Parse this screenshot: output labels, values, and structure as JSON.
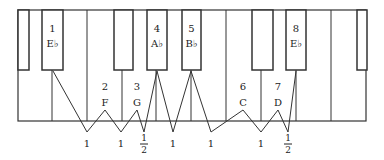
{
  "diagram": {
    "colors": {
      "line": "#333333",
      "background": "#ffffff",
      "text": "#222222"
    },
    "keyboard": {
      "top": 10,
      "bottom": 121,
      "black_bottom": 70,
      "white_dividers": [
        18,
        52,
        87,
        122,
        156,
        191,
        226,
        261,
        296,
        331,
        366
      ],
      "black_keys": [
        {
          "x1": 18,
          "x2": 29,
          "label_num": "",
          "label_note": ""
        },
        {
          "x1": 42,
          "x2": 63,
          "label_num": "1",
          "label_note": "E♭"
        },
        {
          "x1": 114,
          "x2": 133,
          "label_num": "",
          "label_note": ""
        },
        {
          "x1": 147,
          "x2": 167,
          "label_num": "4",
          "label_note": "A♭"
        },
        {
          "x1": 182,
          "x2": 201,
          "label_num": "5",
          "label_note": "B♭"
        },
        {
          "x1": 252,
          "x2": 273,
          "label_num": "",
          "label_note": ""
        },
        {
          "x1": 286,
          "x2": 306,
          "label_num": "8",
          "label_note": "E♭"
        },
        {
          "x1": 357,
          "x2": 367,
          "label_num": "",
          "label_note": ""
        }
      ]
    },
    "white_labels": [
      {
        "x": 105,
        "num": "2",
        "note": "F"
      },
      {
        "x": 137,
        "num": "3",
        "note": "G"
      },
      {
        "x": 243,
        "num": "6",
        "note": "C"
      },
      {
        "x": 278,
        "num": "7",
        "note": "D"
      }
    ],
    "scale_degrees": [
      "1",
      "2",
      "3",
      "4",
      "5",
      "6",
      "7",
      "8"
    ],
    "scale_notes": [
      "E♭",
      "F",
      "G",
      "A♭",
      "B♭",
      "C",
      "D",
      "E♭"
    ],
    "intervals": [
      {
        "x": 87,
        "label": "1",
        "kind": "whole"
      },
      {
        "x": 121,
        "label": "1",
        "kind": "whole"
      },
      {
        "x": 144,
        "label_num": "1",
        "label_den": "2",
        "kind": "half"
      },
      {
        "x": 173,
        "label": "1",
        "kind": "whole"
      },
      {
        "x": 211,
        "label": "1",
        "kind": "whole"
      },
      {
        "x": 261,
        "label": "1",
        "kind": "whole"
      },
      {
        "x": 288,
        "label_num": "1",
        "label_den": "2",
        "kind": "half"
      }
    ],
    "zigzag_points": [
      [
        53,
        71
      ],
      [
        87,
        132
      ],
      [
        105,
        110
      ],
      [
        121,
        132
      ],
      [
        137,
        110
      ],
      [
        144,
        132
      ],
      [
        157,
        71
      ],
      [
        173,
        132
      ],
      [
        191,
        71
      ],
      [
        211,
        132
      ],
      [
        243,
        110
      ],
      [
        261,
        132
      ],
      [
        278,
        110
      ],
      [
        288,
        132
      ],
      [
        296,
        71
      ]
    ]
  }
}
